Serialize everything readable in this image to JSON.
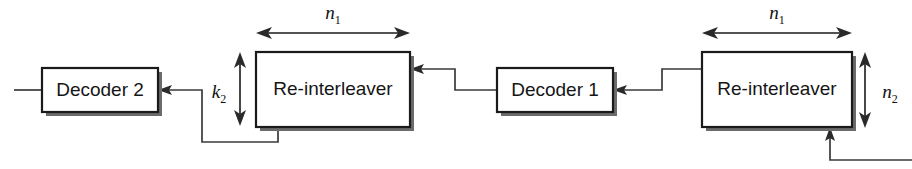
{
  "diagram": {
    "blocks": [
      {
        "id": "decoder2",
        "label": "Decoder 2",
        "x": 42,
        "y": 68,
        "w": 116,
        "h": 44
      },
      {
        "id": "reint_left",
        "label": "Re-interleaver",
        "x": 256,
        "y": 52,
        "w": 154,
        "h": 75
      },
      {
        "id": "decoder1",
        "label": "Decoder 1",
        "x": 497,
        "y": 68,
        "w": 116,
        "h": 44
      },
      {
        "id": "reint_right",
        "label": "Re-interleaver",
        "x": 702,
        "y": 52,
        "w": 150,
        "h": 75
      }
    ],
    "dimensions": [
      {
        "id": "n1_left",
        "symbol": "n",
        "subscript": "1",
        "orientation": "horizontal",
        "x1": 258,
        "x2": 408,
        "y": 33,
        "label_x": 333,
        "label_y": 19
      },
      {
        "id": "n1_right",
        "symbol": "n",
        "subscript": "1",
        "orientation": "horizontal",
        "x1": 704,
        "x2": 850,
        "y": 33,
        "label_x": 777,
        "label_y": 19
      },
      {
        "id": "k2",
        "symbol": "k",
        "subscript": "2",
        "orientation": "vertical",
        "y1": 53,
        "y2": 125,
        "x": 240,
        "label_x": 218,
        "label_y": 95
      },
      {
        "id": "n2",
        "symbol": "n",
        "subscript": "2",
        "orientation": "vertical",
        "y1": 53,
        "y2": 127,
        "x": 865,
        "label_x": 889,
        "label_y": 95
      }
    ],
    "wires": [
      {
        "id": "output-left-stub",
        "description": "output line exiting Decoder 2 to the left edge"
      },
      {
        "id": "reint-left-to-decoder2",
        "description": "feedback from Re-interleaver (left) bottom around to Decoder 2 input"
      },
      {
        "id": "decoder1-to-reint-left",
        "description": "Decoder 1 output stepping up into Re-interleaver (left) right edge"
      },
      {
        "id": "reint-right-to-decoder1",
        "description": "Re-interleaver (right) left edge stepping down into Decoder 1 input"
      },
      {
        "id": "input-bottom-right",
        "description": "channel input entering Re-interleaver (right) from bottom right"
      }
    ],
    "colors": {
      "background": "#ffffff",
      "stroke": "#1a1a1a",
      "wire": "#3a3a3a",
      "shadow": "#6b6b6b",
      "text": "#151515"
    }
  }
}
